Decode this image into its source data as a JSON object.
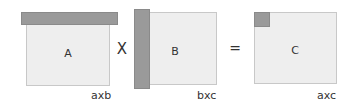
{
  "diagram": {
    "title": "",
    "matrices": [
      {
        "id": "A",
        "label": "A",
        "dims": "axb",
        "highlight": "row"
      },
      {
        "id": "B",
        "label": "B",
        "dims": "bxc",
        "highlight": "column"
      },
      {
        "id": "C",
        "label": "C",
        "dims": "axc",
        "highlight": "element"
      }
    ],
    "operators": {
      "multiply": "X",
      "equals": "="
    },
    "colors": {
      "matrix_fill": "#eeeeee",
      "highlight_fill": "#9a9a9a",
      "border": "#c8c8c8"
    }
  }
}
